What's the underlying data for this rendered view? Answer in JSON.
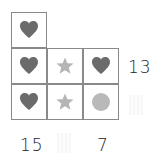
{
  "puzzle": {
    "colors": {
      "heart": "#6b6b6b",
      "star": "#b5b5b5",
      "circle": "#b9b9b9",
      "grid": "#8a8a8a"
    },
    "cells": [
      {
        "row": 0,
        "col": 0,
        "shape": "heart"
      },
      {
        "row": 1,
        "col": 0,
        "shape": "heart"
      },
      {
        "row": 1,
        "col": 1,
        "shape": "star"
      },
      {
        "row": 1,
        "col": 2,
        "shape": "heart"
      },
      {
        "row": 2,
        "col": 0,
        "shape": "heart"
      },
      {
        "row": 2,
        "col": 1,
        "shape": "star"
      },
      {
        "row": 2,
        "col": 2,
        "shape": "circle"
      }
    ],
    "row_sums": {
      "row1": "13",
      "row2": ""
    },
    "col_sums": {
      "col0": "15",
      "col1": "",
      "col2": "7"
    }
  }
}
